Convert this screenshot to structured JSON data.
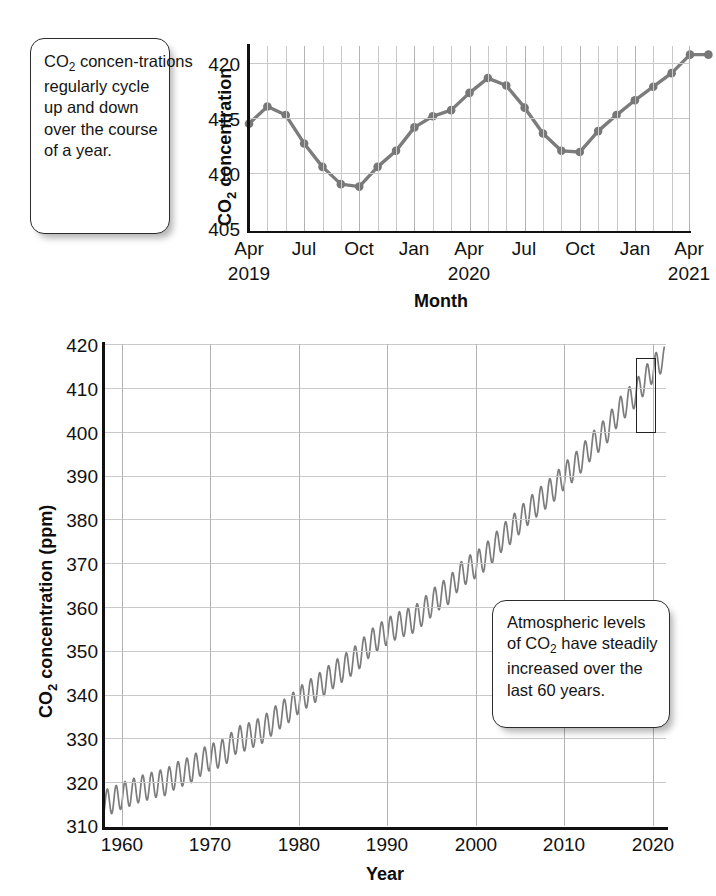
{
  "callouts": {
    "cycle": "CO2 concentrations regularly cycle up and down over the course of a year.",
    "cycle_html_parts": [
      "CO",
      "2",
      " concentrations regularly cycle up and down over the course of a year."
    ],
    "trend": "Atmospheric levels of CO2 have steadily increased over the last 60 years.",
    "trend_html_parts": [
      "Atmospheric levels of CO",
      "2",
      " have steadily increased over the last 60 years."
    ]
  },
  "colors": {
    "line": "#7c7c7c",
    "marker": "#777777",
    "axis": "#111111",
    "grid": "#c9c9cb",
    "grid_major": "#b3b3b6",
    "text": "#111111",
    "callout_border": "#2b2b2b"
  },
  "page_caption": "",
  "chart_data": [
    {
      "id": "monthly",
      "type": "line",
      "title": "",
      "xlabel": "Month",
      "ylabel": "CO2 concentration",
      "ylabel_sub": "2",
      "ylim": [
        405,
        420
      ],
      "yticks": [
        405,
        410,
        415,
        420
      ],
      "xlim": [
        0,
        24
      ],
      "grid": true,
      "legend": "none",
      "markers": true,
      "xtick_labels": [
        "Apr",
        "Jul",
        "Oct",
        "Jan",
        "Apr",
        "Jul",
        "Oct",
        "Jan",
        "Apr"
      ],
      "xtick_positions": [
        0,
        3,
        6,
        9,
        12,
        15,
        18,
        21,
        24
      ],
      "xtick_years": [
        {
          "label": "2019",
          "pos": 0
        },
        {
          "label": "2020",
          "pos": 12
        },
        {
          "label": "2021",
          "pos": 24
        }
      ],
      "x": [
        0,
        1,
        2,
        3,
        4,
        5,
        6,
        7,
        8,
        9,
        10,
        11,
        12,
        13,
        14,
        15,
        16,
        17,
        18,
        19,
        20,
        21,
        22,
        23,
        24
      ],
      "point_labels": [
        "Apr 2019",
        "May 2019",
        "Jun 2019",
        "Jul 2019",
        "Aug 2019",
        "Sep 2019",
        "Oct 2019",
        "Nov 2019",
        "Dec 2019",
        "Jan 2020",
        "Feb 2020",
        "Mar 2020",
        "Apr 2020",
        "May 2020",
        "Jun 2020",
        "Jul 2020",
        "Aug 2020",
        "Sep 2020",
        "Oct 2020",
        "Nov 2020",
        "Dec 2020",
        "Jan 2021",
        "Feb 2021",
        "Mar 2021",
        "Apr 2021"
      ],
      "values": [
        413.7,
        415.1,
        414.4,
        412.1,
        410.2,
        408.8,
        408.6,
        410.2,
        411.5,
        413.4,
        414.3,
        414.8,
        416.2,
        417.4,
        416.8,
        415.0,
        412.9,
        411.5,
        411.4,
        413.1,
        414.4,
        415.6,
        416.7,
        417.8,
        419.3,
        419.3
      ],
      "values_note": "ppm, monthly mean"
    },
    {
      "id": "annual",
      "type": "line",
      "title": "",
      "xlabel": "Year",
      "ylabel": "CO2 concentration (ppm)",
      "ylabel_sub": "2",
      "ylim": [
        310,
        420
      ],
      "yticks": [
        310,
        320,
        330,
        340,
        350,
        360,
        370,
        380,
        390,
        400,
        410,
        420
      ],
      "xlim": [
        1958,
        2021.5
      ],
      "xticks": [
        1960,
        1970,
        1980,
        1990,
        2000,
        2010,
        2020
      ],
      "grid": true,
      "legend": "none",
      "markers": false,
      "seasonal_amplitude_ppm": 3.0,
      "highlight_box": {
        "x_start": 2019.2,
        "x_end": 2021.4,
        "y_start": 405,
        "y_end": 421,
        "label": "inset-region"
      },
      "x": [
        1958,
        1959,
        1960,
        1961,
        1962,
        1963,
        1964,
        1965,
        1966,
        1967,
        1968,
        1969,
        1970,
        1971,
        1972,
        1973,
        1974,
        1975,
        1976,
        1977,
        1978,
        1979,
        1980,
        1981,
        1982,
        1983,
        1984,
        1985,
        1986,
        1987,
        1988,
        1989,
        1990,
        1991,
        1992,
        1993,
        1994,
        1995,
        1996,
        1997,
        1998,
        1999,
        2000,
        2001,
        2002,
        2003,
        2004,
        2005,
        2006,
        2007,
        2008,
        2009,
        2010,
        2011,
        2012,
        2013,
        2014,
        2015,
        2016,
        2017,
        2018,
        2019,
        2020,
        2021
      ],
      "values": [
        315.2,
        315.9,
        316.9,
        317.6,
        318.4,
        319.0,
        319.6,
        320.0,
        321.4,
        322.2,
        323.0,
        324.6,
        325.7,
        326.3,
        327.5,
        329.7,
        330.2,
        331.1,
        332.0,
        333.8,
        335.4,
        336.8,
        338.7,
        340.1,
        341.4,
        343.0,
        344.6,
        346.0,
        347.4,
        349.2,
        351.6,
        353.1,
        354.4,
        355.6,
        356.4,
        357.1,
        358.8,
        360.8,
        362.6,
        363.7,
        366.7,
        368.4,
        369.6,
        371.2,
        373.3,
        375.8,
        377.5,
        379.8,
        381.9,
        383.8,
        385.6,
        387.4,
        389.9,
        391.6,
        393.9,
        396.5,
        398.6,
        400.8,
        404.2,
        406.5,
        408.5,
        411.4,
        414.2,
        416.5
      ]
    }
  ]
}
